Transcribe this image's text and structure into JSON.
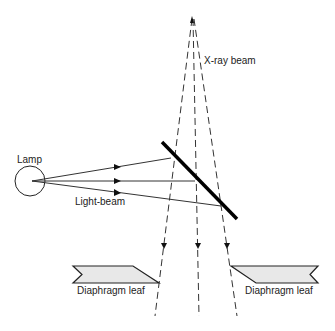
{
  "diagram": {
    "title": "",
    "labels": {
      "xray_beam": "X-ray beam",
      "lamp": "Lamp",
      "light_beam": "Light-beam",
      "diaphragm_leaf_left": "Diaphragm leaf",
      "diaphragm_leaf_right": "Diaphragm leaf"
    },
    "colors": {
      "line": "#111111",
      "leaf_fill": "#e8e8e8",
      "background": "#ffffff"
    }
  }
}
